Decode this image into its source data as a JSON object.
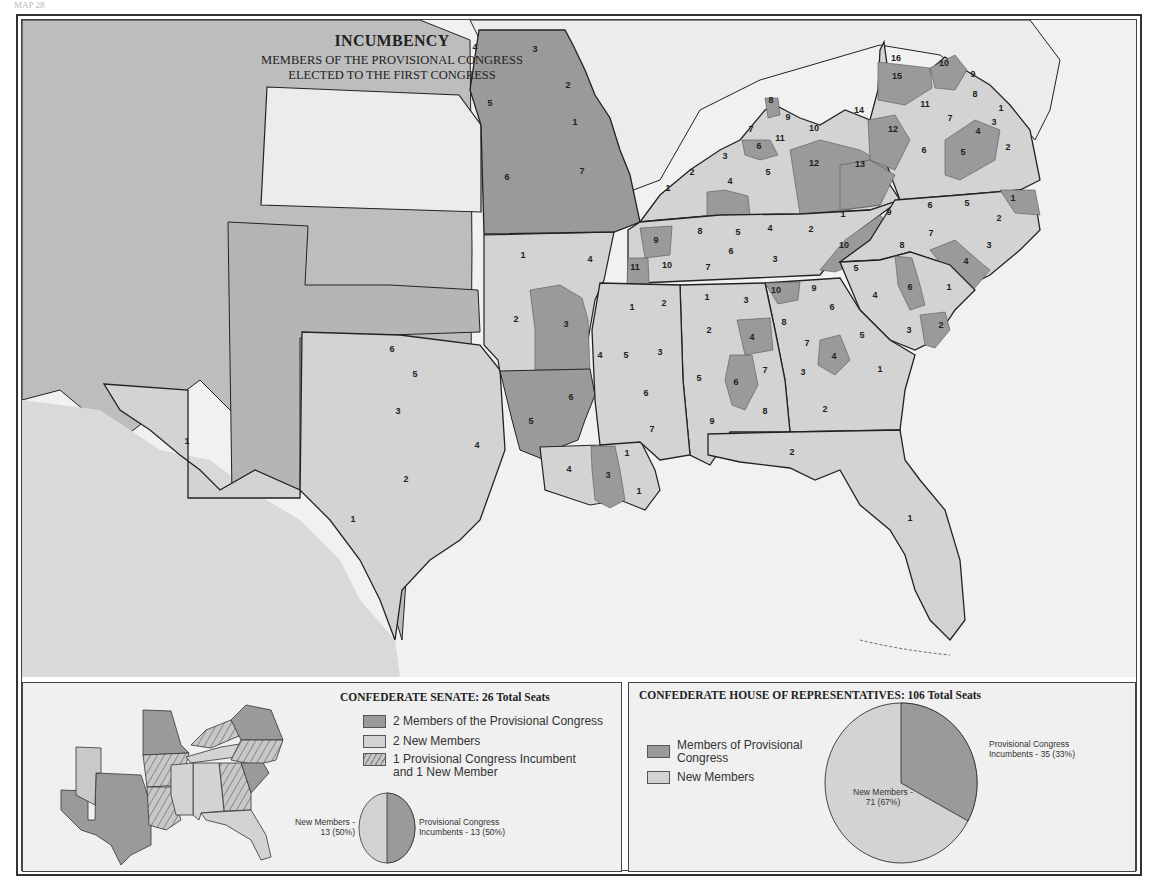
{
  "page_label": "MAP 28",
  "title": {
    "main": "INCUMBENCY",
    "sub_line1": "MEMBERS OF THE PROVISIONAL CONGRESS",
    "sub_line2": "ELECTED TO THE FIRST CONGRESS"
  },
  "colors": {
    "incumbent": "#9a9a9a",
    "new_member": "#d3d3d3",
    "non_confederate": "#bdbdbd",
    "kansas": "#ececec",
    "water": "#f1f1f1",
    "border": "#222222"
  },
  "districts": {
    "missouri": [
      {
        "n": "4",
        "x": 475,
        "y": 50,
        "inc": true
      },
      {
        "n": "3",
        "x": 535,
        "y": 52,
        "inc": true
      },
      {
        "n": "2",
        "x": 568,
        "y": 88,
        "inc": true
      },
      {
        "n": "1",
        "x": 575,
        "y": 125,
        "inc": true
      },
      {
        "n": "5",
        "x": 490,
        "y": 106,
        "inc": true
      },
      {
        "n": "6",
        "x": 507,
        "y": 180,
        "inc": true
      },
      {
        "n": "7",
        "x": 582,
        "y": 174,
        "inc": true
      }
    ],
    "kentucky": [
      {
        "n": "8",
        "x": 771,
        "y": 103,
        "inc": true
      },
      {
        "n": "9",
        "x": 788,
        "y": 120,
        "inc": false
      },
      {
        "n": "10",
        "x": 814,
        "y": 131,
        "inc": false
      },
      {
        "n": "7",
        "x": 751,
        "y": 132,
        "inc": false
      },
      {
        "n": "11",
        "x": 780,
        "y": 141,
        "inc": false
      },
      {
        "n": "6",
        "x": 759,
        "y": 149,
        "inc": true
      },
      {
        "n": "12",
        "x": 814,
        "y": 166,
        "inc": true
      },
      {
        "n": "13",
        "x": 860,
        "y": 167,
        "inc": true
      },
      {
        "n": "14",
        "x": 859,
        "y": 113,
        "inc": false
      },
      {
        "n": "3",
        "x": 725,
        "y": 159,
        "inc": false
      },
      {
        "n": "2",
        "x": 692,
        "y": 175,
        "inc": false
      },
      {
        "n": "5",
        "x": 768,
        "y": 175,
        "inc": false
      },
      {
        "n": "4",
        "x": 730,
        "y": 184,
        "inc": true
      },
      {
        "n": "1",
        "x": 668,
        "y": 191,
        "inc": false
      }
    ],
    "virginia": [
      {
        "n": "16",
        "x": 896,
        "y": 61,
        "inc": true
      },
      {
        "n": "10",
        "x": 944,
        "y": 66,
        "inc": true
      },
      {
        "n": "15",
        "x": 897,
        "y": 79,
        "inc": true
      },
      {
        "n": "9",
        "x": 973,
        "y": 77,
        "inc": false
      },
      {
        "n": "8",
        "x": 975,
        "y": 97,
        "inc": false
      },
      {
        "n": "11",
        "x": 925,
        "y": 107,
        "inc": false
      },
      {
        "n": "1",
        "x": 1001,
        "y": 111,
        "inc": false
      },
      {
        "n": "7",
        "x": 950,
        "y": 121,
        "inc": false
      },
      {
        "n": "3",
        "x": 994,
        "y": 125,
        "inc": true
      },
      {
        "n": "12",
        "x": 893,
        "y": 132,
        "inc": true
      },
      {
        "n": "4",
        "x": 978,
        "y": 134,
        "inc": true
      },
      {
        "n": "2",
        "x": 1008,
        "y": 150,
        "inc": false
      },
      {
        "n": "6",
        "x": 924,
        "y": 153,
        "inc": false
      },
      {
        "n": "5",
        "x": 963,
        "y": 155,
        "inc": true
      }
    ],
    "tennessee": [
      {
        "n": "9",
        "x": 656,
        "y": 243,
        "inc": true
      },
      {
        "n": "8",
        "x": 700,
        "y": 234,
        "inc": false
      },
      {
        "n": "5",
        "x": 738,
        "y": 235,
        "inc": false
      },
      {
        "n": "4",
        "x": 770,
        "y": 231,
        "inc": false
      },
      {
        "n": "2",
        "x": 811,
        "y": 232,
        "inc": false
      },
      {
        "n": "1",
        "x": 843,
        "y": 217,
        "inc": false
      },
      {
        "n": "11",
        "x": 635,
        "y": 270,
        "inc": true
      },
      {
        "n": "10",
        "x": 667,
        "y": 268,
        "inc": false
      },
      {
        "n": "6",
        "x": 731,
        "y": 254,
        "inc": false
      },
      {
        "n": "7",
        "x": 708,
        "y": 270,
        "inc": false
      },
      {
        "n": "3",
        "x": 775,
        "y": 262,
        "inc": false
      },
      {
        "n": "10",
        "x": 844,
        "y": 248,
        "inc": true
      }
    ],
    "north_carolina": [
      {
        "n": "1",
        "x": 1013,
        "y": 201,
        "inc": true
      },
      {
        "n": "9",
        "x": 889,
        "y": 215,
        "inc": false
      },
      {
        "n": "6",
        "x": 930,
        "y": 208,
        "inc": false
      },
      {
        "n": "5",
        "x": 967,
        "y": 206,
        "inc": false
      },
      {
        "n": "2",
        "x": 999,
        "y": 221,
        "inc": false
      },
      {
        "n": "7",
        "x": 931,
        "y": 236,
        "inc": false
      },
      {
        "n": "8",
        "x": 902,
        "y": 248,
        "inc": false
      },
      {
        "n": "3",
        "x": 989,
        "y": 248,
        "inc": false
      },
      {
        "n": "4",
        "x": 966,
        "y": 264,
        "inc": true
      }
    ],
    "south_carolina": [
      {
        "n": "6",
        "x": 910,
        "y": 290,
        "inc": true
      },
      {
        "n": "1",
        "x": 949,
        "y": 290,
        "inc": false
      },
      {
        "n": "2",
        "x": 941,
        "y": 328,
        "inc": true
      },
      {
        "n": "3",
        "x": 909,
        "y": 333,
        "inc": false
      },
      {
        "n": "4",
        "x": 875,
        "y": 298,
        "inc": false
      },
      {
        "n": "5",
        "x": 856,
        "y": 271,
        "inc": false
      }
    ],
    "georgia": [
      {
        "n": "10",
        "x": 776,
        "y": 293,
        "inc": true
      },
      {
        "n": "9",
        "x": 814,
        "y": 291,
        "inc": false
      },
      {
        "n": "6",
        "x": 832,
        "y": 310,
        "inc": false
      },
      {
        "n": "8",
        "x": 784,
        "y": 325,
        "inc": false
      },
      {
        "n": "7",
        "x": 807,
        "y": 346,
        "inc": false
      },
      {
        "n": "5",
        "x": 862,
        "y": 338,
        "inc": false
      },
      {
        "n": "3",
        "x": 803,
        "y": 375,
        "inc": false
      },
      {
        "n": "4",
        "x": 834,
        "y": 359,
        "inc": true
      },
      {
        "n": "2",
        "x": 825,
        "y": 412,
        "inc": false
      },
      {
        "n": "1",
        "x": 880,
        "y": 372,
        "inc": false
      }
    ],
    "alabama": [
      {
        "n": "1",
        "x": 707,
        "y": 300,
        "inc": false
      },
      {
        "n": "3",
        "x": 746,
        "y": 303,
        "inc": false
      },
      {
        "n": "2",
        "x": 709,
        "y": 333,
        "inc": false
      },
      {
        "n": "4",
        "x": 752,
        "y": 340,
        "inc": true
      },
      {
        "n": "5",
        "x": 699,
        "y": 381,
        "inc": false
      },
      {
        "n": "7",
        "x": 765,
        "y": 373,
        "inc": false
      },
      {
        "n": "6",
        "x": 736,
        "y": 385,
        "inc": true
      },
      {
        "n": "8",
        "x": 765,
        "y": 414,
        "inc": false
      },
      {
        "n": "9",
        "x": 712,
        "y": 424,
        "inc": false
      }
    ],
    "mississippi": [
      {
        "n": "1",
        "x": 632,
        "y": 310,
        "inc": false
      },
      {
        "n": "2",
        "x": 664,
        "y": 306,
        "inc": false
      },
      {
        "n": "5",
        "x": 626,
        "y": 358,
        "inc": false
      },
      {
        "n": "3",
        "x": 660,
        "y": 355,
        "inc": false
      },
      {
        "n": "4",
        "x": 600,
        "y": 358,
        "inc": false
      },
      {
        "n": "6",
        "x": 646,
        "y": 396,
        "inc": false
      },
      {
        "n": "7",
        "x": 652,
        "y": 432,
        "inc": false
      }
    ],
    "arkansas": [
      {
        "n": "1",
        "x": 523,
        "y": 258,
        "inc": false
      },
      {
        "n": "4",
        "x": 590,
        "y": 262,
        "inc": false
      },
      {
        "n": "2",
        "x": 516,
        "y": 322,
        "inc": false
      },
      {
        "n": "3",
        "x": 566,
        "y": 327,
        "inc": true
      },
      {
        "n": "5",
        "x": 531,
        "y": 424,
        "inc": true
      },
      {
        "n": "6",
        "x": 571,
        "y": 400,
        "inc": true
      }
    ],
    "louisiana": [
      {
        "n": "4",
        "x": 569,
        "y": 472,
        "inc": false
      },
      {
        "n": "3",
        "x": 608,
        "y": 478,
        "inc": true
      },
      {
        "n": "1",
        "x": 627,
        "y": 456,
        "inc": false
      },
      {
        "n": "1",
        "x": 639,
        "y": 494,
        "inc": false
      }
    ],
    "texas": [
      {
        "n": "6",
        "x": 392,
        "y": 352,
        "inc": false
      },
      {
        "n": "5",
        "x": 415,
        "y": 377,
        "inc": false
      },
      {
        "n": "3",
        "x": 398,
        "y": 414,
        "inc": false
      },
      {
        "n": "4",
        "x": 477,
        "y": 448,
        "inc": false
      },
      {
        "n": "2",
        "x": 406,
        "y": 482,
        "inc": false
      },
      {
        "n": "1",
        "x": 353,
        "y": 522,
        "inc": false
      },
      {
        "n": "1",
        "x": 187,
        "y": 444,
        "inc": false
      }
    ],
    "florida": [
      {
        "n": "2",
        "x": 792,
        "y": 455,
        "inc": false
      },
      {
        "n": "1",
        "x": 910,
        "y": 521,
        "inc": false
      }
    ]
  },
  "senate": {
    "title": "CONFEDERATE SENATE: 26 Total Seats",
    "legend": [
      {
        "key": "dark",
        "label": "2 Members of the Provisional Congress"
      },
      {
        "key": "light",
        "label": "2 New Members"
      },
      {
        "key": "hatch",
        "label_line1": "1 Provisional Congress Incumbent",
        "label_line2": "and 1 New Member"
      }
    ],
    "pie_left_label_line1": "New Members -",
    "pie_left_label_line2": "13 (50%)",
    "pie_right_label_line1": "Provisional Congress",
    "pie_right_label_line2": "Incumbents - 13 (50%)"
  },
  "house": {
    "title": "CONFEDERATE HOUSE OF REPRESENTATIVES: 106 Total Seats",
    "legend": [
      {
        "key": "dark",
        "label_line1": "Members of Provisional",
        "label_line2": "Congress"
      },
      {
        "key": "light",
        "label": "New Members"
      }
    ],
    "pie_left_label_line1": "New Members -",
    "pie_left_label_line2": "71 (67%)",
    "pie_right_label_line1": "Provisional Congress",
    "pie_right_label_line2": "Incumbents - 35 (33%)"
  },
  "chart_data": [
    {
      "type": "pie",
      "title": "CONFEDERATE SENATE: 26 Total Seats",
      "categories": [
        "Provisional Congress Incumbents",
        "New Members"
      ],
      "values": [
        13,
        13
      ],
      "percent": [
        50,
        50
      ]
    },
    {
      "type": "pie",
      "title": "CONFEDERATE HOUSE OF REPRESENTATIVES: 106 Total Seats",
      "categories": [
        "Provisional Congress Incumbents",
        "New Members"
      ],
      "values": [
        35,
        71
      ],
      "percent": [
        33,
        67
      ]
    }
  ]
}
